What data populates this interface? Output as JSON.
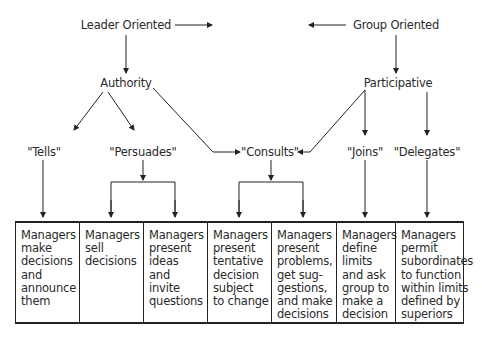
{
  "top": {
    "leader": "Leader Oriented",
    "group": "Group Oriented"
  },
  "middle": {
    "authority": "Authority",
    "participative": "Participative"
  },
  "styles": {
    "tells": "\"Tells\"",
    "persuades": "\"Persuades\"",
    "consults": "\"Consults\"",
    "joins": "\"Joins\"",
    "delegates": "\"Delegates\""
  },
  "boxes": [
    {
      "text": "Managers\nmake\ndecisions\nand\nannounce\nthem"
    },
    {
      "text": "Managers\nsell\ndecisions"
    },
    {
      "text": "Managers\npresent\nideas\nand\ninvite\nquestions"
    },
    {
      "text": "Managers\npresent\ntentative\ndecision\nsubject\nto change"
    },
    {
      "text": "Managers\npresent\nproblems,\nget sug-\ngestions,\nand make\ndecisions"
    },
    {
      "text": "Managers\ndefine\nlimits\nand ask\ngroup to\nmake a\ndecision"
    },
    {
      "text": "Managers\npermit\nsubordinates\nto function\nwithin limits\ndefined by\nsuperiors"
    }
  ]
}
